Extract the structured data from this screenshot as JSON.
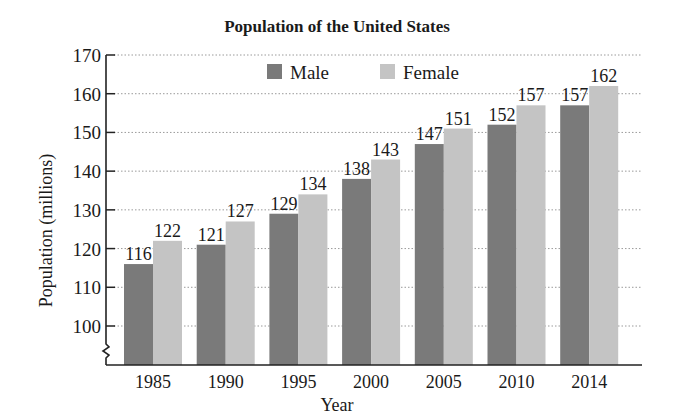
{
  "chart_data": {
    "type": "bar",
    "title": "Population of the United States",
    "xlabel": "Year",
    "ylabel": "Population (millions)",
    "categories": [
      "1985",
      "1990",
      "1995",
      "2000",
      "2005",
      "2010",
      "2014"
    ],
    "series": [
      {
        "name": "Male",
        "values": [
          116,
          121,
          129,
          138,
          147,
          152,
          157
        ],
        "color": "#7a7a7a"
      },
      {
        "name": "Female",
        "values": [
          122,
          127,
          134,
          143,
          151,
          157,
          162
        ],
        "color": "#c4c4c4"
      }
    ],
    "yticks": [
      100,
      110,
      120,
      130,
      140,
      150,
      160,
      170
    ],
    "ylim": [
      90,
      170
    ],
    "axis_break": true,
    "grid": "horizontal-dotted",
    "legend_position": "top-center",
    "data_labels": true
  }
}
